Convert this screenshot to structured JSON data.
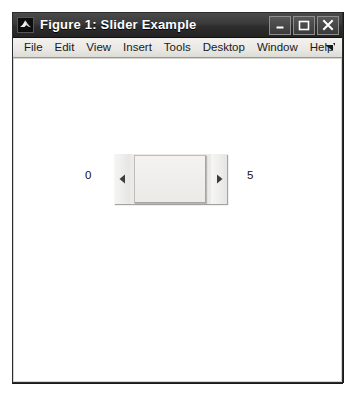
{
  "window": {
    "title": "Figure 1: Slider Example",
    "app_icon": "matlab-membrane-icon",
    "controls": [
      {
        "name": "minimize",
        "glyph": "minimize-icon"
      },
      {
        "name": "maximize",
        "glyph": "maximize-icon"
      },
      {
        "name": "close",
        "glyph": "close-icon"
      }
    ]
  },
  "menu": {
    "items": [
      {
        "label": "File"
      },
      {
        "label": "Edit"
      },
      {
        "label": "View"
      },
      {
        "label": "Insert"
      },
      {
        "label": "Tools"
      },
      {
        "label": "Desktop"
      },
      {
        "label": "Window"
      },
      {
        "label": "Help"
      }
    ],
    "dock_icon": "dock-arrow-icon"
  },
  "slider": {
    "min_label": "0",
    "max_label": "5",
    "value": 5,
    "left_arrow_icon": "triangle-left-icon",
    "right_arrow_icon": "triangle-right-icon"
  },
  "colors": {
    "titlebar": "#2e2e2e",
    "menubar": "#e9e8e4",
    "canvas": "#ffffff",
    "frame_border": "#2b2b2b",
    "slider_face": "#eceae8"
  }
}
